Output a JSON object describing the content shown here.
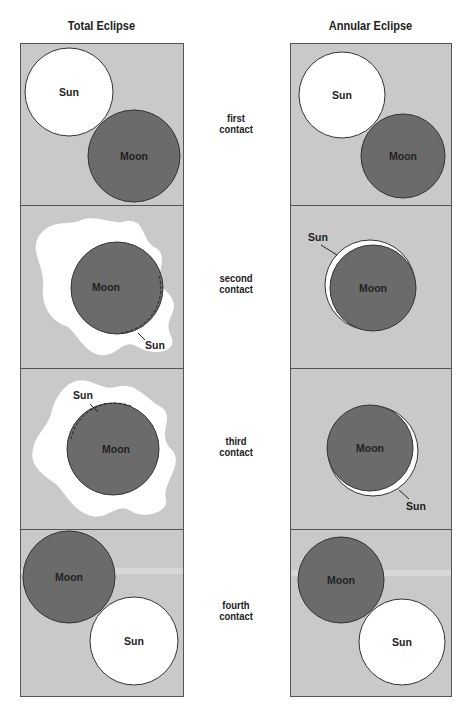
{
  "titles": {
    "left": "Total Eclipse",
    "right": "Annular Eclipse"
  },
  "stages": [
    {
      "label_line1": "first",
      "label_line2": "contact"
    },
    {
      "label_line1": "second",
      "label_line2": "contact"
    },
    {
      "label_line1": "third",
      "label_line2": "contact"
    },
    {
      "label_line1": "fourth",
      "label_line2": "contact"
    }
  ],
  "bodies": {
    "sun": "Sun",
    "moon": "Moon"
  },
  "colors": {
    "panel_bg": "#c9c9c9",
    "moon": "#6b6b6b",
    "sun": "#ffffff",
    "border": "#555555"
  }
}
